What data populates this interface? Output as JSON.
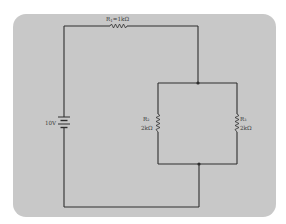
{
  "diagram": {
    "type": "circuit-schematic",
    "background_color": "#c8c8c8",
    "wire_color": "#2e2e2e",
    "source": {
      "label": "10V",
      "kind": "battery"
    },
    "resistors": [
      {
        "id": "R1",
        "label": "R₁=1kΩ",
        "sub": "1",
        "value": "1kΩ",
        "position": "series-top"
      },
      {
        "id": "R2",
        "label": "R₂",
        "value": "2kΩ",
        "position": "parallel-left"
      },
      {
        "id": "R3",
        "label": "R₃",
        "value": "2kΩ",
        "position": "parallel-right"
      }
    ],
    "junctions": [
      "top-node",
      "bottom-node"
    ]
  }
}
